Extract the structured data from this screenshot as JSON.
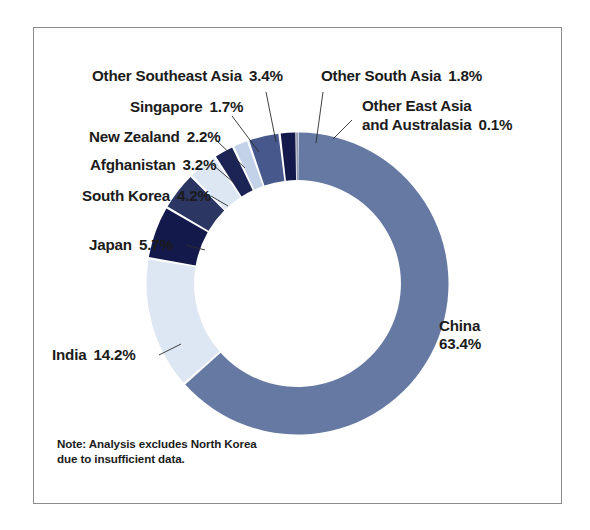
{
  "figure": {
    "note": "Note: Analysis excludes North Korea due to insufficient data.",
    "frame_color": "#8b8b8b",
    "background": "#ffffff"
  },
  "labels": {
    "china": {
      "name": "China",
      "pct": "63.4%"
    },
    "india": {
      "name": "India",
      "pct": "14.2%"
    },
    "japan": {
      "name": "Japan",
      "pct": "5.7%"
    },
    "south_korea": {
      "name": "South Korea",
      "pct": "4.2%"
    },
    "afghanistan": {
      "name": "Afghanistan",
      "pct": "3.2%"
    },
    "new_zealand": {
      "name": "New Zealand",
      "pct": "2.2%"
    },
    "singapore": {
      "name": "Singapore",
      "pct": "1.7%"
    },
    "other_southeast_asia": {
      "name": "Other Southeast Asia",
      "pct": "3.4%"
    },
    "other_south_asia": {
      "name": "Other South Asia",
      "pct": "1.8%"
    },
    "other_east_asia_line1": "Other East Asia",
    "other_east_asia_line2": "and Australasia",
    "other_east_asia_pct": "0.1%"
  },
  "chart_data": {
    "type": "pie",
    "variant": "donut",
    "title": "",
    "subtitle": "",
    "xlabel": "",
    "ylabel": "",
    "legend_position": "none",
    "grid": false,
    "units": "percent",
    "start_angle_deg": 0,
    "direction": "clockwise",
    "inner_radius_ratio": 0.685,
    "annotations": [
      "Note: Analysis excludes North Korea due to insufficient data."
    ],
    "categories": [
      "China",
      "India",
      "Japan",
      "South Korea",
      "Afghanistan",
      "New Zealand",
      "Singapore",
      "Other Southeast Asia",
      "Other South Asia",
      "Other East Asia and Australasia"
    ],
    "values": [
      63.4,
      14.2,
      5.7,
      4.2,
      3.2,
      2.2,
      1.7,
      3.4,
      1.8,
      0.1
    ],
    "colors": [
      "#6679a3",
      "#dde6f3",
      "#131a4b",
      "#2b3663",
      "#dde6f3",
      "#1c2456",
      "#c3d2e8",
      "#46588c",
      "#131a4b",
      "#2b3663"
    ],
    "slice_gap_deg": 0.9,
    "total": 99.9
  }
}
